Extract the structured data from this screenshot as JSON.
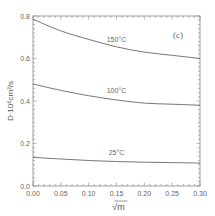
{
  "chart_data": {
    "type": "line",
    "title": "",
    "panel_label": "(c)",
    "xlabel": "√m",
    "ylabel": "D·10⁶cm²/s",
    "xlim": [
      0.0,
      0.3
    ],
    "ylim": [
      0.0,
      0.8
    ],
    "grid": false,
    "legend": "none (inline curve labels)",
    "x_ticks": [
      "0.00",
      "0.05",
      "0.10",
      "0.15",
      "0.20",
      "0.25",
      "0.30"
    ],
    "y_ticks": [
      "0.0",
      "0.2",
      "0.4",
      "0.6",
      "0.8"
    ],
    "x": [
      0.0,
      0.05,
      0.1,
      0.15,
      0.2,
      0.25,
      0.3
    ],
    "series": [
      {
        "name": "150°C",
        "values": [
          0.785,
          0.73,
          0.69,
          0.655,
          0.63,
          0.615,
          0.6
        ]
      },
      {
        "name": "100°C",
        "values": [
          0.48,
          0.45,
          0.425,
          0.405,
          0.39,
          0.385,
          0.38
        ]
      },
      {
        "name": "25°C",
        "values": [
          0.135,
          0.127,
          0.12,
          0.115,
          0.112,
          0.11,
          0.108
        ]
      }
    ],
    "annotations": [
      {
        "text": "150°C",
        "x": 0.15,
        "y": 0.66
      },
      {
        "text": "100°C",
        "x": 0.15,
        "y": 0.42
      },
      {
        "text": "25°C",
        "x": 0.15,
        "y": 0.125
      }
    ]
  }
}
